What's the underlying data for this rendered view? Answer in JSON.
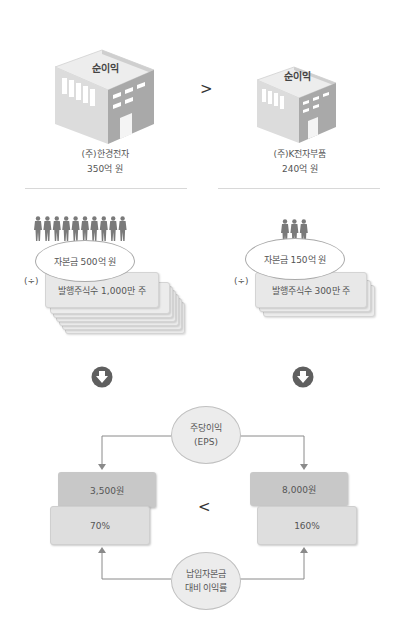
{
  "companies": [
    {
      "building_label": "순이익",
      "name": "(주)한경전자",
      "net_income": "350억 원",
      "capital": "자본금 500억 원",
      "shares": "발행주식수 1,000만 주",
      "people_count": 10,
      "eps": "3,500원",
      "return_on_paid_in_capital": "70%"
    },
    {
      "building_label": "순이익",
      "name": "(주)K전자부품",
      "net_income": "240억 원",
      "capital": "자본금 150억 원",
      "shares": "발행주식수 300만 주",
      "people_count": 3,
      "eps": "8,000원",
      "return_on_paid_in_capital": "160%"
    }
  ],
  "comparisons": {
    "net_income": ">",
    "results": "<"
  },
  "divide_symbol": "(÷)",
  "eps_label": {
    "line1": "주당이익",
    "line2": "(EPS)"
  },
  "ratio_label": {
    "line1": "납입자본금",
    "line2": "대비 이익률"
  },
  "icons": {
    "building": "building-icon",
    "person": "person-icon",
    "down_arrow": "down-arrow-circle-icon"
  },
  "colors": {
    "building_top": "#e6e6e6",
    "building_front": "#d9d9d9",
    "building_side": "#a8a8a8",
    "arrow_circle": "#5f5f5f",
    "box_dark": "#c8c8c8",
    "box_light": "#dedede",
    "connector": "#8a8a8a"
  }
}
